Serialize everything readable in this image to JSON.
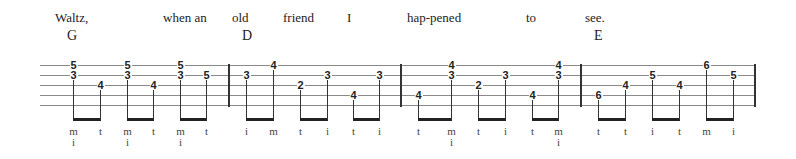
{
  "lyrics": [
    {
      "text": "Waltz,",
      "x": 55
    },
    {
      "text": "when an",
      "x": 163
    },
    {
      "text": "old",
      "x": 232
    },
    {
      "text": "friend",
      "x": 283
    },
    {
      "text": "I",
      "x": 347
    },
    {
      "text": "hap-pened",
      "x": 407
    },
    {
      "text": "to",
      "x": 526
    },
    {
      "text": "see.",
      "x": 585
    }
  ],
  "chords": [
    {
      "name": "G",
      "x": 67
    },
    {
      "name": "D",
      "x": 242
    },
    {
      "name": "E",
      "x": 594
    }
  ],
  "staff": {
    "lines_y": [
      65,
      75,
      85,
      95,
      105
    ],
    "left": 40,
    "right": 754,
    "barlines_x": [
      228,
      400,
      580,
      754
    ]
  },
  "notes": [
    {
      "x": 73,
      "frets": [
        {
          "f": "5",
          "s": 1
        },
        {
          "f": "3",
          "s": 2
        }
      ],
      "finger": [
        "m",
        "i"
      ]
    },
    {
      "x": 100,
      "frets": [
        {
          "f": "4",
          "s": 3
        }
      ],
      "finger": [
        "t"
      ]
    },
    {
      "x": 127,
      "frets": [
        {
          "f": "5",
          "s": 1
        },
        {
          "f": "3",
          "s": 2
        }
      ],
      "finger": [
        "m",
        "i"
      ]
    },
    {
      "x": 153,
      "frets": [
        {
          "f": "4",
          "s": 3
        }
      ],
      "finger": [
        "t"
      ]
    },
    {
      "x": 180,
      "frets": [
        {
          "f": "5",
          "s": 1
        },
        {
          "f": "3",
          "s": 2
        }
      ],
      "finger": [
        "m",
        "i"
      ]
    },
    {
      "x": 206,
      "frets": [
        {
          "f": "5",
          "s": 2
        }
      ],
      "finger": [
        "t"
      ]
    },
    {
      "x": 246,
      "frets": [
        {
          "f": "3",
          "s": 2
        }
      ],
      "finger": [
        "i"
      ]
    },
    {
      "x": 273,
      "frets": [
        {
          "f": "4",
          "s": 1
        }
      ],
      "finger": [
        "m"
      ]
    },
    {
      "x": 300,
      "frets": [
        {
          "f": "2",
          "s": 3
        }
      ],
      "finger": [
        "t"
      ]
    },
    {
      "x": 327,
      "frets": [
        {
          "f": "3",
          "s": 2
        }
      ],
      "finger": [
        "i"
      ]
    },
    {
      "x": 353,
      "frets": [
        {
          "f": "4",
          "s": 4
        }
      ],
      "finger": [
        "t"
      ]
    },
    {
      "x": 379,
      "frets": [
        {
          "f": "3",
          "s": 2
        }
      ],
      "finger": [
        "i"
      ]
    },
    {
      "x": 418,
      "frets": [
        {
          "f": "4",
          "s": 4
        }
      ],
      "finger": [
        "t"
      ]
    },
    {
      "x": 451,
      "frets": [
        {
          "f": "4",
          "s": 1
        },
        {
          "f": "3",
          "s": 2
        }
      ],
      "finger": [
        "m",
        "i"
      ]
    },
    {
      "x": 478,
      "frets": [
        {
          "f": "2",
          "s": 3
        }
      ],
      "finger": [
        "t"
      ]
    },
    {
      "x": 505,
      "frets": [
        {
          "f": "3",
          "s": 2
        }
      ],
      "finger": [
        "i"
      ]
    },
    {
      "x": 532,
      "frets": [
        {
          "f": "4",
          "s": 4
        }
      ],
      "finger": [
        "t"
      ]
    },
    {
      "x": 558,
      "frets": [
        {
          "f": "4",
          "s": 1
        },
        {
          "f": "3",
          "s": 2
        }
      ],
      "finger": [
        "m",
        "i"
      ]
    },
    {
      "x": 598,
      "frets": [
        {
          "f": "6",
          "s": 4
        }
      ],
      "finger": [
        "t"
      ]
    },
    {
      "x": 625,
      "frets": [
        {
          "f": "4",
          "s": 3
        }
      ],
      "finger": [
        "t"
      ]
    },
    {
      "x": 652,
      "frets": [
        {
          "f": "5",
          "s": 2
        }
      ],
      "finger": [
        "i"
      ]
    },
    {
      "x": 679,
      "frets": [
        {
          "f": "4",
          "s": 3
        }
      ],
      "finger": [
        "t"
      ]
    },
    {
      "x": 706,
      "frets": [
        {
          "f": "6",
          "s": 1
        }
      ],
      "finger": [
        "m"
      ]
    },
    {
      "x": 733,
      "frets": [
        {
          "f": "5",
          "s": 2
        }
      ],
      "finger": [
        "i"
      ]
    }
  ]
}
